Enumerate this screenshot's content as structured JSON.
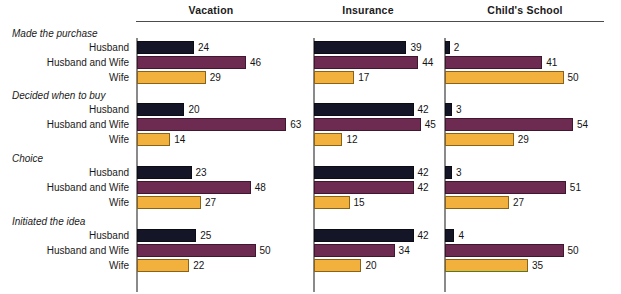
{
  "chart_data": {
    "type": "bar",
    "orientation": "horizontal",
    "title": "",
    "xlabel": "",
    "ylabel": "",
    "xlim": [
      0,
      65
    ],
    "grid": false,
    "legend": "none",
    "panel_titles": [
      "Vacation",
      "Insurance",
      "Child's School"
    ],
    "groups": [
      "Made the purchase",
      "Decided when to buy",
      "Choice",
      "Initiated the idea"
    ],
    "categories": [
      "Husband",
      "Husband and Wife",
      "Wife"
    ],
    "colors": {
      "husband": "#141627",
      "husband_and_wife": "#6e2b51",
      "wife": "#f2b03c"
    },
    "panels": [
      {
        "name": "Vacation",
        "groups": [
          {
            "group": "Made the purchase",
            "values": [
              24,
              46,
              29
            ]
          },
          {
            "group": "Decided when to buy",
            "values": [
              20,
              63,
              14
            ]
          },
          {
            "group": "Choice",
            "values": [
              23,
              48,
              27
            ]
          },
          {
            "group": "Initiated the idea",
            "values": [
              25,
              50,
              22
            ]
          }
        ]
      },
      {
        "name": "Insurance",
        "groups": [
          {
            "group": "Made the purchase",
            "values": [
              39,
              44,
              17
            ]
          },
          {
            "group": "Decided when to buy",
            "values": [
              42,
              45,
              12
            ]
          },
          {
            "group": "Choice",
            "values": [
              42,
              42,
              15
            ]
          },
          {
            "group": "Initiated the idea",
            "values": [
              42,
              34,
              20
            ]
          }
        ]
      },
      {
        "name": "Child's School",
        "groups": [
          {
            "group": "Made the purchase",
            "values": [
              2,
              41,
              50
            ]
          },
          {
            "group": "Decided when to buy",
            "values": [
              3,
              54,
              29
            ]
          },
          {
            "group": "Choice",
            "values": [
              3,
              51,
              27
            ]
          },
          {
            "group": "Initiated the idea",
            "values": [
              4,
              50,
              35
            ]
          }
        ]
      }
    ]
  }
}
